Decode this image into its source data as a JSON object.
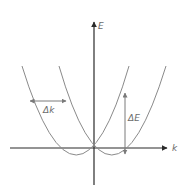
{
  "diagram": {
    "axes": {
      "x_label": "k",
      "y_label": "E"
    },
    "annotations": {
      "delta_k": "Δk",
      "delta_e": "ΔE"
    },
    "colors": {
      "axis": "#2a2a2a",
      "curve": "#8a8a8a",
      "arrow": "#7a7a7a",
      "label": "#6b6b6b"
    }
  }
}
